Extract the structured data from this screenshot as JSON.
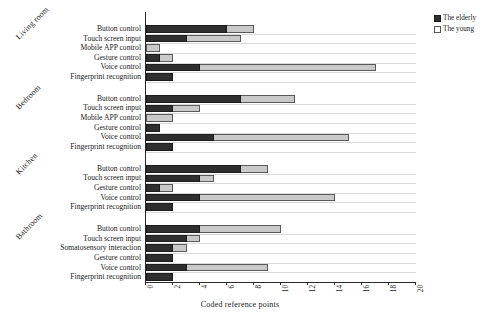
{
  "chart_data": {
    "type": "bar",
    "orientation": "horizontal",
    "title": "",
    "xlabel": "Coded reference points",
    "ylabel": "",
    "xlim": [
      0,
      20
    ],
    "xticks": [
      0,
      2,
      4,
      6,
      8,
      10,
      12,
      14,
      16,
      18,
      20
    ],
    "grid": true,
    "legend_position": "top-right",
    "legend": [
      "The elderly",
      "The young"
    ],
    "series": [
      {
        "name": "The elderly",
        "color": "#2e2e2e"
      },
      {
        "name": "The young",
        "color": "#c9c9c9"
      }
    ],
    "groups": [
      {
        "name": "Living room",
        "categories": [
          "Button control",
          "Touch screen input",
          "Mobile APP control",
          "Gesture control",
          "Voice control",
          "Fingerprint recognition"
        ],
        "values": {
          "The elderly": [
            6,
            3,
            0,
            1,
            4,
            2
          ],
          "The young": [
            8,
            7,
            1,
            2,
            17,
            0
          ]
        }
      },
      {
        "name": "Bedroom",
        "categories": [
          "Button control",
          "Touch screen input",
          "Mobile APP control",
          "Gesture control",
          "Voice control",
          "Fingerprint recognition"
        ],
        "values": {
          "The elderly": [
            7,
            2,
            0,
            1,
            5,
            2
          ],
          "The young": [
            11,
            4,
            2,
            1,
            15,
            0
          ]
        }
      },
      {
        "name": "Kitchen",
        "categories": [
          "Button control",
          "Touch screen input",
          "Gesture control",
          "Voice control",
          "Fingerprint recognition"
        ],
        "values": {
          "The elderly": [
            7,
            4,
            1,
            4,
            2
          ],
          "The young": [
            9,
            5,
            2,
            14,
            0
          ]
        }
      },
      {
        "name": "Bathroom",
        "categories": [
          "Button control",
          "Touch screen input",
          "Somatosensory interaction",
          "Gesture control",
          "Voice control",
          "Fingerprint recognition"
        ],
        "values": {
          "The elderly": [
            4,
            3,
            2,
            2,
            3,
            2
          ],
          "The young": [
            10,
            4,
            3,
            2,
            9,
            0
          ]
        }
      }
    ]
  },
  "axis": {
    "x_title": "Coded reference points",
    "tick_labels": [
      "0",
      "2",
      "4",
      "6",
      "8",
      "10",
      "12",
      "14",
      "16",
      "18",
      "20"
    ]
  },
  "legend": {
    "items": [
      {
        "label": "The elderly",
        "swatch": "dark"
      },
      {
        "label": "The young",
        "swatch": "light"
      }
    ]
  }
}
